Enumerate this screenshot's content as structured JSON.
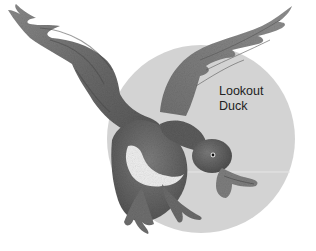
{
  "illustration": {
    "subject": "flying duck",
    "background_shape": "circle",
    "colors": {
      "background": "#ffffff",
      "circle": "#d3d3d3",
      "text": "#222222"
    }
  },
  "caption": {
    "line1": "Lookout",
    "line2": "Duck"
  }
}
